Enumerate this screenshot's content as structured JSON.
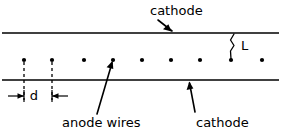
{
  "figure": {
    "type": "technical-line-diagram",
    "width": 281,
    "height": 138,
    "background_color": "#ffffff",
    "line_color": "#000000"
  },
  "labels": {
    "cathode_top": "cathode",
    "cathode_bottom": "cathode",
    "anode_wires": "anode wires",
    "wire_spacing": "d",
    "gap_distance": "L"
  },
  "geometry": {
    "cathode_top_y": 33,
    "cathode_bottom_y": 80,
    "anode_plane_y": 60,
    "cathode_x_start": 2,
    "cathode_x_end": 279,
    "anode_wire_x": [
      24,
      52,
      84,
      113,
      142,
      171,
      200,
      231,
      262
    ],
    "anode_wire_count": 9,
    "wire_dot_radius": 2.1,
    "dim_d_line_y": 96,
    "dim_d_left_x": 24,
    "dim_d_right_x": 52,
    "dim_L_x": 231,
    "dim_L_top_y": 34,
    "dim_L_bottom_y": 59
  },
  "leaders": {
    "cathode_top_arrow": {
      "from_x": 172,
      "from_y": 30,
      "to_x": 157,
      "to_y": 19
    },
    "cathode_bottom_arrow": {
      "from_x": 195,
      "from_y": 112,
      "to_x": 189,
      "to_y": 82
    },
    "anode_wires_arrow": {
      "from_x": 97,
      "from_y": 114,
      "to_x": 113,
      "to_y": 62
    }
  },
  "text_positions": {
    "cathode_top": {
      "x": 150,
      "y": 11
    },
    "cathode_bottom": {
      "x": 196,
      "y": 123
    },
    "anode_wires": {
      "x": 62,
      "y": 123
    },
    "wire_spacing_d": {
      "x": 34,
      "y": 96
    },
    "gap_L": {
      "x": 241,
      "y": 46
    }
  }
}
